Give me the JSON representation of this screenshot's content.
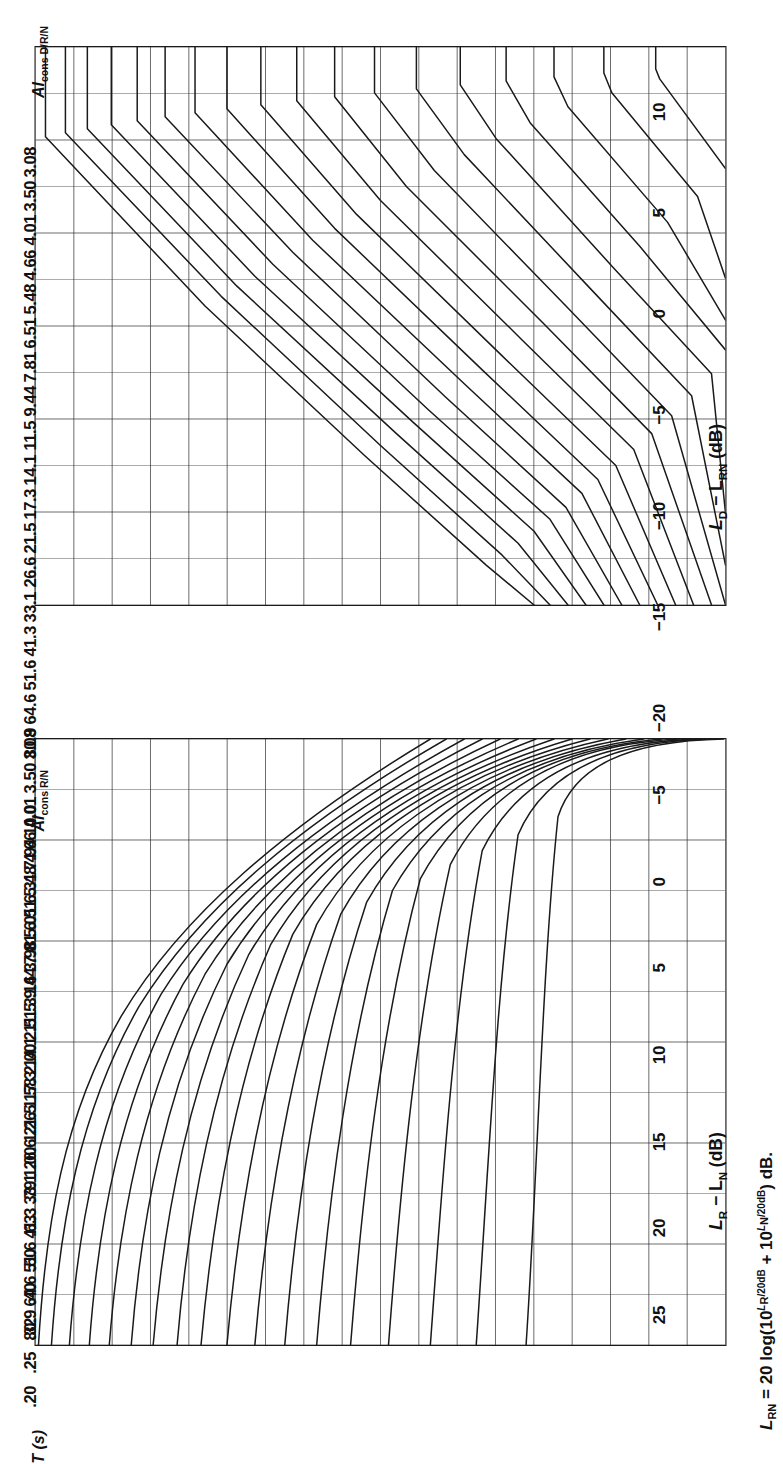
{
  "figure": {
    "orientation": "rotated-90",
    "ink_color": "#1a1a1a",
    "grid_color": "#2b2b2b"
  },
  "panels": {
    "upper": {
      "column_header": "Al",
      "column_header_sub": "cons D/R/N",
      "axis_title_main": "L",
      "axis_title_sub1": "D",
      "axis_title_mid": " − L",
      "axis_title_sub2": "RN",
      "axis_title_unit": " (dB)",
      "tick_labels": [
        "−20",
        "−15",
        "−10",
        "−5",
        "0",
        "5",
        "10"
      ],
      "value_labels": [
        "3.08",
        "3.50",
        "4.01",
        "4.66",
        "5.48",
        "6.51",
        "7.81",
        "9.44",
        "11.5",
        "14.1",
        "17.3",
        "21.5",
        "26.6",
        "33.1",
        "41.3",
        "51.6",
        "64.6",
        "80.9"
      ]
    },
    "lower": {
      "column_header": "Al",
      "column_header_sub": "cons R/N",
      "axis_title_main": "L",
      "axis_title_sub1": "R",
      "axis_title_mid": " − L",
      "axis_title_sub2": "N",
      "axis_title_unit": " (dB)",
      "tick_labels": [
        "25",
        "20",
        "15",
        "10",
        "5",
        "0",
        "−5"
      ],
      "value_labels": [
        "3.08",
        "3.50",
        "4.01",
        "4.66",
        "5.48",
        "6.51",
        "7.81",
        "9.44",
        "11.5",
        "14.1",
        "17.3",
        "21.5",
        "26.6",
        "33.1",
        "41.3",
        "51.6",
        "64.6",
        "80.9"
      ],
      "t_header": "T",
      "t_header_unit": " (s)",
      "t_labels": [
        ".20",
        ".25",
        ".32",
        ".40",
        ".50",
        ".63",
        ".79",
        "1.00",
        "1.26",
        "1.58",
        "2.00",
        "2.51",
        "3.16",
        "3.98",
        "5.01",
        "6.31",
        "7.94",
        "10.0"
      ]
    }
  },
  "footnote": {
    "lead": "L",
    "lead_sub": "RN",
    "body_a": " = 20 log(10",
    "exp_a": "L",
    "exp_a_sub": "R",
    "exp_a_tail": "/20dB",
    "body_b": " + 10",
    "exp_b": "L",
    "exp_b_sub": "N",
    "exp_b_tail": "/20dB",
    "body_c": ") dB."
  },
  "chart_data": [
    {
      "type": "line",
      "title": "Articulation loss of consonants, direct/reverberant/noise",
      "xlabel": "L_D − L_RN (dB)",
      "ylabel": "Al_cons D/R/N (%)",
      "xlim": [
        -20,
        10
      ],
      "ylim": [
        0,
        18
      ],
      "grid": true,
      "legend": "none",
      "xticks": [
        -20,
        -15,
        -10,
        -5,
        0,
        5,
        10
      ],
      "x_minor_step": 2.5,
      "curve_labels": [
        "3.08",
        "3.50",
        "4.01",
        "4.66",
        "5.48",
        "6.51",
        "7.81",
        "9.44",
        "11.5",
        "14.1",
        "17.3",
        "21.5",
        "26.6",
        "33.1",
        "41.3",
        "51.6",
        "64.6",
        "80.9"
      ],
      "n_curves": 18,
      "note": "Each curve maps the direct-to-(reverberant+noise) level difference to the resulting %Al_cons; curves are flat at left (-20 dB) and descend steeply toward +10 dB.",
      "series": [
        {
          "name": "3.08",
          "x": [
            -20,
            -15,
            -10,
            -5,
            0,
            5,
            10
          ],
          "y": [
            0.1,
            0.12,
            0.16,
            0.26,
            0.55,
            1.35,
            3.0
          ]
        },
        {
          "name": "3.50",
          "x": [
            -20,
            -15,
            -10,
            -5,
            0,
            5,
            10
          ],
          "y": [
            0.35,
            0.38,
            0.44,
            0.6,
            1.0,
            1.95,
            3.7
          ]
        },
        {
          "name": "4.01",
          "x": [
            -20,
            -15,
            -10,
            -5,
            0,
            5,
            10
          ],
          "y": [
            0.75,
            0.78,
            0.86,
            1.05,
            1.5,
            2.55,
            4.4
          ]
        },
        {
          "name": "4.66",
          "x": [
            -20,
            -15,
            -10,
            -5,
            0,
            5,
            10
          ],
          "y": [
            1.2,
            1.24,
            1.33,
            1.55,
            2.05,
            3.2,
            5.1
          ]
        },
        {
          "name": "5.48",
          "x": [
            -20,
            -15,
            -10,
            -5,
            0,
            5,
            10
          ],
          "y": [
            1.7,
            1.74,
            1.84,
            2.08,
            2.62,
            3.85,
            5.85
          ]
        },
        {
          "name": "6.51",
          "x": [
            -20,
            -15,
            -10,
            -5,
            0,
            5,
            10
          ],
          "y": [
            2.2,
            2.25,
            2.36,
            2.62,
            3.2,
            4.5,
            6.6
          ]
        },
        {
          "name": "7.81",
          "x": [
            -20,
            -15,
            -10,
            -5,
            0,
            5,
            10
          ],
          "y": [
            2.75,
            2.8,
            2.92,
            3.2,
            3.82,
            5.2,
            7.35
          ]
        },
        {
          "name": "9.44",
          "x": [
            -20,
            -15,
            -10,
            -5,
            0,
            5,
            10
          ],
          "y": [
            3.3,
            3.36,
            3.49,
            3.79,
            4.45,
            5.9,
            8.1
          ]
        },
        {
          "name": "11.5",
          "x": [
            -20,
            -15,
            -10,
            -5,
            0,
            5,
            10
          ],
          "y": [
            3.9,
            3.96,
            4.1,
            4.42,
            5.12,
            6.62,
            8.85
          ]
        },
        {
          "name": "14.1",
          "x": [
            -20,
            -15,
            -10,
            -5,
            0,
            5,
            10
          ],
          "y": [
            4.55,
            4.61,
            4.76,
            5.1,
            5.83,
            7.38,
            9.6
          ]
        },
        {
          "name": "17.3",
          "x": [
            -20,
            -15,
            -10,
            -5,
            0,
            5,
            10
          ],
          "y": [
            5.25,
            5.32,
            5.48,
            5.83,
            6.58,
            8.15,
            10.35
          ]
        },
        {
          "name": "21.5",
          "x": [
            -20,
            -15,
            -10,
            -5,
            0,
            5,
            10
          ],
          "y": [
            6.0,
            6.07,
            6.24,
            6.6,
            7.38,
            8.95,
            11.1
          ]
        },
        {
          "name": "26.6",
          "x": [
            -20,
            -15,
            -10,
            -5,
            0,
            5,
            10
          ],
          "y": [
            6.85,
            6.92,
            7.1,
            7.47,
            8.26,
            9.8,
            11.85
          ]
        },
        {
          "name": "33.1",
          "x": [
            -20,
            -15,
            -10,
            -5,
            0,
            5,
            10
          ],
          "y": [
            7.8,
            7.88,
            8.06,
            8.44,
            9.22,
            10.7,
            12.6
          ]
        },
        {
          "name": "41.3",
          "x": [
            -20,
            -15,
            -10,
            -5,
            0,
            5,
            10
          ],
          "y": [
            8.9,
            8.98,
            9.17,
            9.55,
            10.3,
            11.68,
            13.35
          ]
        },
        {
          "name": "51.6",
          "x": [
            -20,
            -15,
            -10,
            -5,
            0,
            5,
            10
          ],
          "y": [
            10.15,
            10.23,
            10.42,
            10.8,
            11.5,
            12.74,
            14.1
          ]
        },
        {
          "name": "64.6",
          "x": [
            -20,
            -15,
            -10,
            -5,
            0,
            5,
            10
          ],
          "y": [
            11.6,
            11.68,
            11.87,
            12.23,
            12.88,
            13.92,
            14.85
          ]
        },
        {
          "name": "80.9",
          "x": [
            -20,
            -15,
            -10,
            -5,
            0,
            5,
            10
          ],
          "y": [
            13.3,
            13.38,
            13.56,
            13.88,
            14.42,
            15.2,
            15.8
          ]
        }
      ]
    },
    {
      "type": "line",
      "title": "Articulation loss of consonants vs reverberation time and signal-to-noise ratio",
      "xlabel": "L_R − L_N (dB)",
      "ylabel": "Al_cons R/N (%)  /  T (s)",
      "xlim": [
        25,
        -5
      ],
      "ylim": [
        0,
        18
      ],
      "grid": true,
      "legend": "none",
      "xticks": [
        25,
        20,
        15,
        10,
        5,
        0,
        -5
      ],
      "x_minor_step": 2.5,
      "curve_labels": [
        "3.08",
        "3.50",
        "4.01",
        "4.66",
        "5.48",
        "6.51",
        "7.81",
        "9.44",
        "11.5",
        "14.1",
        "17.3",
        "21.5",
        "26.6",
        "33.1",
        "41.3",
        "51.6",
        "64.6",
        "80.9"
      ],
      "t_labels": [
        ".20",
        ".25",
        ".32",
        ".40",
        ".50",
        ".63",
        ".79",
        "1.00",
        "1.26",
        "1.58",
        "2.00",
        "2.51",
        "3.16",
        "3.98",
        "5.01",
        "6.31",
        "7.94",
        "10.0"
      ],
      "n_curves": 18,
      "note": "Each curve is a reverberation time T; curves are vertical (constant Al_cons) at high S/N and bend toward larger Al_cons as L_R − L_N falls below ~5 dB.",
      "series": [
        {
          "name": ".20",
          "x": [
            25,
            20,
            15,
            10,
            5,
            0,
            -5
          ],
          "y": [
            0.3,
            0.3,
            0.32,
            0.45,
            1.05,
            2.35,
            4.1
          ]
        },
        {
          "name": ".25",
          "x": [
            25,
            20,
            15,
            10,
            5,
            0,
            -5
          ],
          "y": [
            0.9,
            0.9,
            0.93,
            1.08,
            1.7,
            3.0,
            4.7
          ]
        },
        {
          "name": ".32",
          "x": [
            25,
            20,
            15,
            10,
            5,
            0,
            -5
          ],
          "y": [
            1.5,
            1.5,
            1.54,
            1.7,
            2.32,
            3.62,
            5.3
          ]
        },
        {
          "name": ".40",
          "x": [
            25,
            20,
            15,
            10,
            5,
            0,
            -5
          ],
          "y": [
            2.1,
            2.1,
            2.14,
            2.32,
            2.95,
            4.24,
            5.9
          ]
        },
        {
          "name": ".50",
          "x": [
            25,
            20,
            15,
            10,
            5,
            0,
            -5
          ],
          "y": [
            2.7,
            2.7,
            2.75,
            2.94,
            3.58,
            4.86,
            6.5
          ]
        },
        {
          "name": ".63",
          "x": [
            25,
            20,
            15,
            10,
            5,
            0,
            -5
          ],
          "y": [
            3.3,
            3.3,
            3.36,
            3.56,
            4.21,
            5.48,
            7.1
          ]
        },
        {
          "name": ".79",
          "x": [
            25,
            20,
            15,
            10,
            5,
            0,
            -5
          ],
          "y": [
            3.95,
            3.95,
            4.01,
            4.22,
            4.88,
            6.13,
            7.72
          ]
        },
        {
          "name": "1.00",
          "x": [
            25,
            20,
            15,
            10,
            5,
            0,
            -5
          ],
          "y": [
            4.6,
            4.6,
            4.67,
            4.89,
            5.55,
            6.78,
            8.34
          ]
        },
        {
          "name": "1.26",
          "x": [
            25,
            20,
            15,
            10,
            5,
            0,
            -5
          ],
          "y": [
            5.3,
            5.3,
            5.37,
            5.6,
            6.26,
            7.46,
            8.96
          ]
        },
        {
          "name": "1.58",
          "x": [
            25,
            20,
            15,
            10,
            5,
            0,
            -5
          ],
          "y": [
            6.0,
            6.0,
            6.08,
            6.31,
            6.97,
            8.14,
            9.58
          ]
        },
        {
          "name": "2.00",
          "x": [
            25,
            20,
            15,
            10,
            5,
            0,
            -5
          ],
          "y": [
            6.75,
            6.75,
            6.83,
            7.07,
            7.72,
            8.85,
            10.2
          ]
        },
        {
          "name": "2.51",
          "x": [
            25,
            20,
            15,
            10,
            5,
            0,
            -5
          ],
          "y": [
            7.55,
            7.55,
            7.63,
            7.87,
            8.51,
            9.58,
            10.82
          ]
        },
        {
          "name": "3.16",
          "x": [
            25,
            20,
            15,
            10,
            5,
            0,
            -5
          ],
          "y": [
            8.4,
            8.4,
            8.48,
            8.72,
            9.34,
            10.34,
            11.45
          ]
        },
        {
          "name": "3.98",
          "x": [
            25,
            20,
            15,
            10,
            5,
            0,
            -5
          ],
          "y": [
            9.3,
            9.3,
            9.38,
            9.62,
            10.21,
            11.14,
            12.1
          ]
        },
        {
          "name": "5.01",
          "x": [
            25,
            20,
            15,
            10,
            5,
            0,
            -5
          ],
          "y": [
            10.3,
            10.3,
            10.38,
            10.61,
            11.16,
            12.0,
            12.8
          ]
        },
        {
          "name": "6.31",
          "x": [
            25,
            20,
            15,
            10,
            5,
            0,
            -5
          ],
          "y": [
            11.4,
            11.4,
            11.47,
            11.69,
            12.19,
            12.92,
            13.55
          ]
        },
        {
          "name": "7.94",
          "x": [
            25,
            20,
            15,
            10,
            5,
            0,
            -5
          ],
          "y": [
            12.6,
            12.6,
            12.67,
            12.87,
            13.3,
            13.9,
            14.35
          ]
        },
        {
          "name": "10.0",
          "x": [
            25,
            20,
            15,
            10,
            5,
            0,
            -5
          ],
          "y": [
            13.95,
            13.95,
            14.01,
            14.18,
            14.52,
            14.96,
            15.25
          ]
        }
      ]
    }
  ]
}
